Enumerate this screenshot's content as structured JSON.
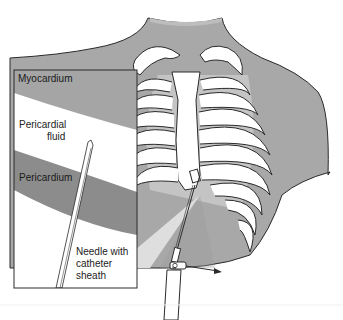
{
  "figure": {
    "inset": {
      "labels": {
        "myocardium": "Myocardium",
        "pericardial_fluid_line1": "Pericardial",
        "pericardial_fluid_line2": "fluid",
        "pericardium": "Pericardium",
        "needle_line1": "Needle with",
        "needle_line2": "catheter",
        "needle_line3": "sheath"
      }
    },
    "colors": {
      "body": "#a8a8a8",
      "myocardium": "#a5a5a5",
      "pericardium": "#8c8c8c",
      "fluid": "#ffffff",
      "bone": "#ffffff",
      "outline": "#2a2a2a",
      "cone": "#d9d9d9"
    }
  }
}
